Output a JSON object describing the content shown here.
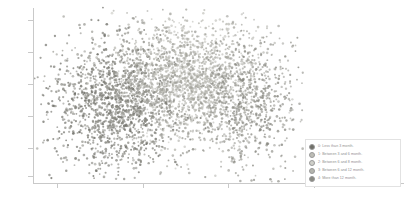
{
  "chart_data": {
    "type": "scatter",
    "title": "",
    "xlabel": "",
    "ylabel": "",
    "grid": false,
    "legend_position": "bottom-right",
    "xlim": [
      0,
      100
    ],
    "ylim": [
      0,
      100
    ],
    "xticks": [
      "",
      "",
      "",
      ""
    ],
    "yticks": [
      "",
      "",
      "",
      "",
      "",
      ""
    ],
    "series": [
      {
        "name": "0: Less than 3 month.",
        "color": "#6f6f68",
        "marker": "circle",
        "n_points": 900,
        "cluster_center": [
          30,
          44
        ],
        "cluster_spread": [
          12,
          19
        ]
      },
      {
        "name": "1: Between 3 and 6 month.",
        "color": "#8c8c85",
        "marker": "circle",
        "n_points": 800,
        "cluster_center": [
          36,
          48
        ],
        "cluster_spread": [
          13,
          20
        ]
      },
      {
        "name": "2: Between 6 and 8 month.",
        "color": "#b9b9b2",
        "marker": "circle",
        "n_points": 850,
        "cluster_center": [
          57,
          62
        ],
        "cluster_spread": [
          13,
          17
        ]
      },
      {
        "name": "3: Between 6 and 12 month.",
        "color": "#a4a49d",
        "marker": "circle",
        "n_points": 700,
        "cluster_center": [
          63,
          58
        ],
        "cluster_spread": [
          12,
          18
        ]
      },
      {
        "name": "4: More than 12 month.",
        "color": "#8a8a83",
        "marker": "circle",
        "n_points": 650,
        "cluster_center": [
          82,
          45
        ],
        "cluster_spread": [
          9,
          19
        ]
      }
    ]
  },
  "legend": {
    "items": [
      {
        "label": "0: Less than 3 month.",
        "color": "#6f6f68"
      },
      {
        "label": "1: Between 3 and 6 month.",
        "color": "#bdbdb6"
      },
      {
        "label": "2: Between 6 and 8 month.",
        "color": "#cfcfc9"
      },
      {
        "label": "3: Between 6 and 12 month.",
        "color": "#b5b5ae"
      },
      {
        "label": "4: More than 12 month.",
        "color": "#8a8a83"
      }
    ]
  },
  "axes": {
    "y_tick_labels": [
      "",
      "",
      "",
      "",
      "",
      ""
    ],
    "x_tick_labels": [
      "",
      "",
      "",
      ""
    ]
  }
}
